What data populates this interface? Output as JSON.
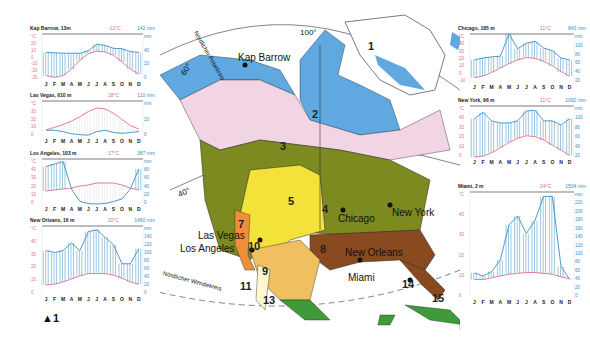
{
  "chart_data": [
    {
      "type": "line",
      "title": "Kap Barrow, 13m",
      "annual_temp": "-12°C",
      "annual_precip": "142 mm",
      "categories": [
        "J",
        "F",
        "M",
        "A",
        "M",
        "J",
        "J",
        "A",
        "S",
        "O",
        "N",
        "D"
      ],
      "series": [
        {
          "name": "Temperatur °C",
          "values": [
            -26,
            -28,
            -26,
            -18,
            -7,
            1,
            4,
            3,
            -1,
            -9,
            -18,
            -24
          ]
        },
        {
          "name": "Niederschlag mm",
          "values": [
            5,
            4,
            3,
            3,
            3,
            9,
            25,
            22,
            15,
            14,
            7,
            5
          ]
        }
      ],
      "temp_axis": [
        "°C",
        "20",
        "10",
        "0",
        "-10",
        "-20",
        "-30"
      ],
      "precip_axis": [
        "mm",
        "40",
        "20",
        "0"
      ]
    },
    {
      "type": "line",
      "title": "Las Vegas, 610 m",
      "annual_temp": "18°C",
      "annual_precip": "110 mm",
      "categories": [
        "J",
        "F",
        "M",
        "A",
        "M",
        "J",
        "J",
        "A",
        "S",
        "O",
        "N",
        "D"
      ],
      "series": [
        {
          "name": "Temperatur °C",
          "values": [
            7,
            10,
            13,
            17,
            22,
            28,
            32,
            31,
            26,
            19,
            12,
            8
          ]
        },
        {
          "name": "Niederschlag mm",
          "values": [
            13,
            13,
            10,
            5,
            3,
            2,
            10,
            13,
            8,
            6,
            8,
            10
          ]
        }
      ],
      "temp_axis": [
        "°C",
        "30",
        "20",
        "10",
        "0"
      ],
      "precip_axis": [
        "mm",
        "20",
        "0"
      ]
    },
    {
      "type": "line",
      "title": "Los Angeles, 103 m",
      "annual_temp": "17°C",
      "annual_precip": "387 mm",
      "categories": [
        "J",
        "F",
        "M",
        "A",
        "M",
        "J",
        "J",
        "A",
        "S",
        "O",
        "N",
        "D"
      ],
      "series": [
        {
          "name": "Temperatur °C",
          "values": [
            13,
            14,
            15,
            16,
            18,
            19,
            21,
            21,
            21,
            19,
            16,
            14
          ]
        },
        {
          "name": "Niederschlag mm",
          "values": [
            75,
            80,
            85,
            30,
            5,
            1,
            0,
            1,
            5,
            10,
            30,
            70
          ]
        }
      ],
      "temp_axis": [
        "°C",
        "40",
        "30",
        "20",
        "10",
        "0"
      ],
      "precip_axis": [
        "mm",
        "80",
        "60",
        "40",
        "20",
        "0"
      ]
    },
    {
      "type": "line",
      "title": "New Orleans, 16 m",
      "annual_temp": "20°C",
      "annual_precip": "1460 mm",
      "categories": [
        "J",
        "F",
        "M",
        "A",
        "M",
        "J",
        "J",
        "A",
        "S",
        "O",
        "N",
        "D"
      ],
      "series": [
        {
          "name": "Temperatur °C",
          "values": [
            12,
            13,
            16,
            20,
            24,
            27,
            27,
            27,
            25,
            21,
            16,
            13
          ]
        },
        {
          "name": "Niederschlag mm",
          "values": [
            115,
            110,
            115,
            135,
            115,
            165,
            170,
            150,
            130,
            80,
            80,
            120
          ]
        }
      ],
      "temp_axis": [
        "°C",
        "40",
        "30",
        "20",
        "10",
        "0"
      ],
      "precip_axis": [
        "mm",
        "140",
        "120",
        "100",
        "80",
        "60",
        "40",
        "20",
        "0"
      ]
    },
    {
      "type": "line",
      "title": "Chicago, 185 m",
      "annual_temp": "11°C",
      "annual_precip": "843 mm",
      "categories": [
        "J",
        "F",
        "M",
        "A",
        "M",
        "J",
        "J",
        "A",
        "S",
        "O",
        "N",
        "D"
      ],
      "series": [
        {
          "name": "Temperatur °C",
          "values": [
            -4,
            -2,
            3,
            9,
            15,
            20,
            23,
            22,
            18,
            12,
            4,
            -2
          ]
        },
        {
          "name": "Niederschlag mm",
          "values": [
            40,
            45,
            48,
            50,
            110,
            70,
            85,
            90,
            72,
            65,
            45,
            40
          ]
        }
      ],
      "temp_axis": [
        "°C",
        "40",
        "30",
        "20",
        "10",
        "0",
        "-10"
      ],
      "precip_axis": [
        "mm",
        "100",
        "80",
        "60",
        "40",
        "20"
      ]
    },
    {
      "type": "line",
      "title": "New York, 96 m",
      "annual_temp": "11°C",
      "annual_precip": "1092 mm",
      "categories": [
        "J",
        "F",
        "M",
        "A",
        "M",
        "J",
        "J",
        "A",
        "S",
        "O",
        "N",
        "D"
      ],
      "series": [
        {
          "name": "Temperatur °C",
          "values": [
            0,
            1,
            5,
            11,
            17,
            22,
            25,
            24,
            20,
            14,
            8,
            2
          ]
        },
        {
          "name": "Niederschlag mm",
          "values": [
            90,
            105,
            85,
            80,
            80,
            85,
            108,
            110,
            85,
            85,
            75,
            90
          ]
        }
      ],
      "temp_axis": [
        "°C",
        "40",
        "30",
        "20",
        "10",
        "0"
      ],
      "precip_axis": [
        "mm",
        "100",
        "80",
        "60",
        "40",
        "20"
      ]
    },
    {
      "type": "line",
      "title": "Miami, 2 m",
      "annual_temp": "24°C",
      "annual_precip": "1504 mm",
      "categories": [
        "J",
        "F",
        "M",
        "A",
        "M",
        "J",
        "J",
        "A",
        "S",
        "O",
        "N",
        "D"
      ],
      "series": [
        {
          "name": "Temperatur °C",
          "values": [
            20,
            20,
            22,
            24,
            26,
            27,
            28,
            28,
            27,
            26,
            23,
            21
          ]
        },
        {
          "name": "Niederschlag mm",
          "values": [
            55,
            48,
            58,
            85,
            165,
            185,
            145,
            175,
            230,
            230,
            70,
            40
          ]
        }
      ],
      "temp_axis": [
        "°C",
        "40",
        "30",
        "20",
        "10",
        "0"
      ],
      "precip_axis": [
        "mm",
        "220",
        "200",
        "180",
        "160",
        "140",
        "120",
        "100",
        "80",
        "60",
        "40",
        "20",
        "0"
      ]
    }
  ],
  "map": {
    "cities": [
      "Kap Barrow",
      "Las Vegas",
      "Los Angeles",
      "Chicago",
      "New York",
      "New Orleans",
      "Miami"
    ],
    "graticule": {
      "meridian": "100°",
      "lat60": "60°",
      "lat40": "40°"
    },
    "arctic_circle": "Nördlicher Polarkreis",
    "tropic": "Nördlicher Wendekreis",
    "zones": [
      "1",
      "2",
      "3",
      "4",
      "5",
      "7",
      "8",
      "9",
      "10",
      "11",
      "13",
      "14",
      "15"
    ]
  },
  "footnote": "▲1",
  "colors": {
    "temp": "#e0708a",
    "precip": "#3a8fc4",
    "precip_fill": "#a9d7ef",
    "tundra": "#5fa9e0",
    "taiga": "#f2d5e5",
    "mixed": "#7c8a1f",
    "steppe": "#f3e23a",
    "subtrop": "#8a4a1f"
  }
}
